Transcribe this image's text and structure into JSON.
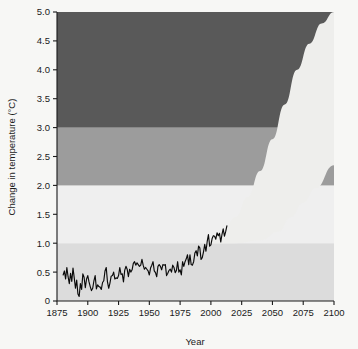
{
  "chart_data": {
    "type": "area",
    "title": "",
    "xlabel": "Year",
    "ylabel": "Change in temperature (°C)",
    "xlim": [
      1875,
      2100
    ],
    "ylim": [
      0,
      5.0
    ],
    "grid": false,
    "legend": "none",
    "xticks": [
      1875,
      1900,
      1925,
      1950,
      1975,
      2000,
      2025,
      2050,
      2075,
      2100
    ],
    "xtick_labels": [
      "1875",
      "1900",
      "1925",
      "1950",
      "1975",
      "2000",
      "2025",
      "2050",
      "2075",
      "2100"
    ],
    "yticks": [
      0,
      0.5,
      1.0,
      1.5,
      2.0,
      2.5,
      3.0,
      3.5,
      4.0,
      4.5,
      5.0
    ],
    "ytick_labels": [
      "0",
      "0.5",
      "1.0",
      "1.5",
      "2.0",
      "2.5",
      "3.0",
      "3.5",
      "4.0",
      "4.5",
      "5.0"
    ],
    "bands": [
      {
        "name": "band-0-1",
        "from": 0.0,
        "to": 1.0,
        "color": "#dcdcdc"
      },
      {
        "name": "band-1-2",
        "from": 1.0,
        "to": 2.0,
        "color": "#efefef"
      },
      {
        "name": "band-2-3",
        "from": 2.0,
        "to": 3.0,
        "color": "#9c9c9c"
      },
      {
        "name": "band-3-5",
        "from": 3.0,
        "to": 5.0,
        "color": "#595959"
      }
    ],
    "projection_wedge": {
      "name": "projection-uncertainty-wedge",
      "color": "#eeeeec",
      "start_year": 2000,
      "end_year": 2100,
      "upper_bound": [
        [
          2000,
          1.05
        ],
        [
          2010,
          1.2
        ],
        [
          2020,
          1.45
        ],
        [
          2030,
          1.8
        ],
        [
          2040,
          2.25
        ],
        [
          2050,
          2.8
        ],
        [
          2060,
          3.4
        ],
        [
          2070,
          4.0
        ],
        [
          2080,
          4.45
        ],
        [
          2090,
          4.8
        ],
        [
          2100,
          5.0
        ]
      ],
      "lower_bound": [
        [
          2000,
          1.0
        ],
        [
          2020,
          1.0
        ],
        [
          2040,
          1.05
        ],
        [
          2055,
          1.2
        ],
        [
          2065,
          1.45
        ],
        [
          2075,
          1.7
        ],
        [
          2085,
          1.95
        ],
        [
          2100,
          2.35
        ]
      ]
    },
    "series": [
      {
        "name": "observed-temperature-anomaly",
        "color": "#0a0a0a",
        "x_start": 1880,
        "x_end": 2013,
        "values": [
          [
            1880,
            0.45
          ],
          [
            1881,
            0.52
          ],
          [
            1882,
            0.38
          ],
          [
            1883,
            0.58
          ],
          [
            1884,
            0.42
          ],
          [
            1885,
            0.3
          ],
          [
            1886,
            0.48
          ],
          [
            1887,
            0.34
          ],
          [
            1888,
            0.57
          ],
          [
            1889,
            0.4
          ],
          [
            1890,
            0.22
          ],
          [
            1891,
            0.36
          ],
          [
            1892,
            0.12
          ],
          [
            1893,
            0.08
          ],
          [
            1894,
            0.3
          ],
          [
            1895,
            0.2
          ],
          [
            1896,
            0.47
          ],
          [
            1897,
            0.41
          ],
          [
            1898,
            0.23
          ],
          [
            1899,
            0.38
          ],
          [
            1900,
            0.44
          ],
          [
            1901,
            0.33
          ],
          [
            1902,
            0.25
          ],
          [
            1903,
            0.18
          ],
          [
            1904,
            0.22
          ],
          [
            1905,
            0.35
          ],
          [
            1906,
            0.44
          ],
          [
            1907,
            0.21
          ],
          [
            1908,
            0.28
          ],
          [
            1909,
            0.25
          ],
          [
            1910,
            0.24
          ],
          [
            1911,
            0.2
          ],
          [
            1912,
            0.32
          ],
          [
            1913,
            0.35
          ],
          [
            1914,
            0.52
          ],
          [
            1915,
            0.58
          ],
          [
            1916,
            0.33
          ],
          [
            1917,
            0.22
          ],
          [
            1918,
            0.31
          ],
          [
            1919,
            0.43
          ],
          [
            1920,
            0.44
          ],
          [
            1921,
            0.5
          ],
          [
            1922,
            0.38
          ],
          [
            1923,
            0.4
          ],
          [
            1924,
            0.39
          ],
          [
            1925,
            0.44
          ],
          [
            1926,
            0.58
          ],
          [
            1927,
            0.46
          ],
          [
            1928,
            0.47
          ],
          [
            1929,
            0.33
          ],
          [
            1930,
            0.53
          ],
          [
            1931,
            0.6
          ],
          [
            1932,
            0.55
          ],
          [
            1933,
            0.42
          ],
          [
            1934,
            0.55
          ],
          [
            1935,
            0.5
          ],
          [
            1936,
            0.54
          ],
          [
            1937,
            0.65
          ],
          [
            1938,
            0.68
          ],
          [
            1939,
            0.62
          ],
          [
            1940,
            0.66
          ],
          [
            1941,
            0.63
          ],
          [
            1942,
            0.6
          ],
          [
            1943,
            0.62
          ],
          [
            1944,
            0.72
          ],
          [
            1945,
            0.62
          ],
          [
            1946,
            0.55
          ],
          [
            1947,
            0.58
          ],
          [
            1948,
            0.55
          ],
          [
            1949,
            0.52
          ],
          [
            1950,
            0.45
          ],
          [
            1951,
            0.57
          ],
          [
            1952,
            0.62
          ],
          [
            1953,
            0.68
          ],
          [
            1954,
            0.52
          ],
          [
            1955,
            0.49
          ],
          [
            1956,
            0.42
          ],
          [
            1957,
            0.6
          ],
          [
            1958,
            0.63
          ],
          [
            1959,
            0.6
          ],
          [
            1960,
            0.54
          ],
          [
            1961,
            0.63
          ],
          [
            1962,
            0.62
          ],
          [
            1963,
            0.63
          ],
          [
            1964,
            0.44
          ],
          [
            1965,
            0.48
          ],
          [
            1966,
            0.53
          ],
          [
            1967,
            0.55
          ],
          [
            1968,
            0.5
          ],
          [
            1969,
            0.62
          ],
          [
            1970,
            0.58
          ],
          [
            1971,
            0.49
          ],
          [
            1972,
            0.53
          ],
          [
            1973,
            0.68
          ],
          [
            1974,
            0.5
          ],
          [
            1975,
            0.54
          ],
          [
            1976,
            0.45
          ],
          [
            1977,
            0.68
          ],
          [
            1978,
            0.6
          ],
          [
            1979,
            0.68
          ],
          [
            1980,
            0.73
          ],
          [
            1981,
            0.8
          ],
          [
            1982,
            0.63
          ],
          [
            1983,
            0.8
          ],
          [
            1984,
            0.63
          ],
          [
            1985,
            0.62
          ],
          [
            1986,
            0.68
          ],
          [
            1987,
            0.83
          ],
          [
            1988,
            0.87
          ],
          [
            1989,
            0.78
          ],
          [
            1990,
            0.95
          ],
          [
            1991,
            0.92
          ],
          [
            1992,
            0.72
          ],
          [
            1993,
            0.75
          ],
          [
            1994,
            0.85
          ],
          [
            1995,
            0.98
          ],
          [
            1996,
            0.86
          ],
          [
            1997,
            1.03
          ],
          [
            1998,
            1.15
          ],
          [
            1999,
            0.95
          ],
          [
            2000,
            0.97
          ],
          [
            2001,
            1.08
          ],
          [
            2002,
            1.13
          ],
          [
            2003,
            1.12
          ],
          [
            2004,
            1.07
          ],
          [
            2005,
            1.18
          ],
          [
            2006,
            1.13
          ],
          [
            2007,
            1.17
          ],
          [
            2008,
            1.02
          ],
          [
            2009,
            1.15
          ],
          [
            2010,
            1.25
          ],
          [
            2011,
            1.12
          ],
          [
            2012,
            1.2
          ],
          [
            2013,
            1.3
          ]
        ]
      }
    ]
  }
}
